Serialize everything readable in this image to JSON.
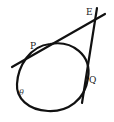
{
  "diagram": {
    "type": "geometry-tangents-to-circle",
    "stroke_color": "#111111",
    "background": "#ffffff",
    "labels": {
      "E": "E",
      "P": "P",
      "Q": "Q",
      "theta": "θ"
    },
    "elements": {
      "circle": {
        "cx": 54,
        "cy": 80,
        "rx": 36,
        "ry": 31
      },
      "tangent_PE": {
        "x1": 12,
        "y1": 67,
        "x2": 105,
        "y2": 14
      },
      "tangent_QE": {
        "x1": 97,
        "y1": 8,
        "x2": 82,
        "y2": 103
      }
    }
  }
}
